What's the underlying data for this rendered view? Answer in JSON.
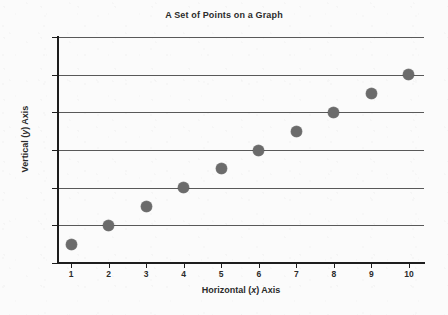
{
  "chart_data": {
    "type": "scatter",
    "title": "A Set of Points on a Graph",
    "xlabel_parts": {
      "prefix": "Horizontal (",
      "variable": "x",
      "suffix": ") Axis"
    },
    "ylabel_parts": {
      "prefix": "Vertical (",
      "variable": "y",
      "suffix": ") Axis"
    },
    "xlabel": "Horizontal (x) Axis",
    "ylabel": "Vertical (y) Axis",
    "x": [
      1,
      2,
      3,
      4,
      5,
      6,
      7,
      8,
      9,
      10
    ],
    "values": [
      1,
      2,
      3,
      4,
      5,
      6,
      7,
      8,
      9,
      10
    ],
    "series": [
      {
        "name": "points",
        "points": [
          {
            "x": 1,
            "y": 1
          },
          {
            "x": 2,
            "y": 2
          },
          {
            "x": 3,
            "y": 3
          },
          {
            "x": 4,
            "y": 4
          },
          {
            "x": 5,
            "y": 5
          },
          {
            "x": 6,
            "y": 6
          },
          {
            "x": 7,
            "y": 7
          },
          {
            "x": 8,
            "y": 8
          },
          {
            "x": 9,
            "y": 9
          },
          {
            "x": 10,
            "y": 10
          }
        ],
        "marker_color": "#6b6b6b"
      }
    ],
    "xlim": [
      0,
      10.4
    ],
    "ylim": [
      0,
      12
    ],
    "xticks": [
      1,
      2,
      3,
      4,
      5,
      6,
      7,
      8,
      9,
      10
    ],
    "xtick_labels": [
      "1",
      "2",
      "3",
      "4",
      "5",
      "6",
      "7",
      "8",
      "9",
      "10"
    ],
    "yticks": [
      0,
      2,
      4,
      6,
      8,
      10,
      12
    ],
    "ytick_labels": [
      "0",
      "2",
      "4",
      "6",
      "8",
      "10",
      "12"
    ],
    "gridlines_y": [
      2,
      4,
      6,
      8,
      10,
      12
    ],
    "grid": "horizontal",
    "grid_color": "#595959",
    "axis_color": "#1d1d1d",
    "legend": null,
    "legend_position": "none",
    "background_color": "#fbfbfb"
  }
}
